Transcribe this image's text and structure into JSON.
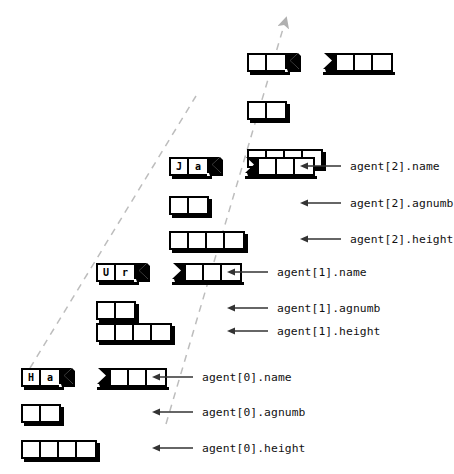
{
  "diagram": {
    "background": "#ffffff",
    "ink": "#000000",
    "guide_color": "#b8b8b8",
    "guides": [
      {
        "name": "array-progression-line-left",
        "x1": 30,
        "y1": 368,
        "x2": 196,
        "y2": 96,
        "arrow": false
      },
      {
        "name": "array-progression-line-right",
        "x1": 166,
        "y1": 424,
        "x2": 287,
        "y2": 18,
        "arrow": true
      }
    ],
    "fields": [
      {
        "key": "name",
        "cells_left": 2,
        "cells_right": 3,
        "torn": true,
        "label_suffix": ".name"
      },
      {
        "key": "agnumb",
        "cells_left": 2,
        "cells_right": 0,
        "torn": false,
        "label_suffix": ".agnumb"
      },
      {
        "key": "height",
        "cells_left": 4,
        "cells_right": 0,
        "torn": false,
        "label_suffix": ".height"
      }
    ],
    "records": [
      {
        "index": "partial",
        "visible": false,
        "name_chars": [
          "",
          ""
        ],
        "name_tail_cells": 3,
        "agnumb_cells": 2,
        "height_cells": 4,
        "labels": {
          "name": "",
          "agnumb": "",
          "height": ""
        }
      },
      {
        "index": "2",
        "visible": true,
        "name_chars": [
          "J",
          "a"
        ],
        "name_tail_cells": 3,
        "agnumb_cells": 2,
        "height_cells": 4,
        "labels": {
          "name": "agent[2].name",
          "agnumb": "agent[2].agnumb",
          "height": "agent[2].height"
        }
      },
      {
        "index": "1",
        "visible": true,
        "name_chars": [
          "U",
          "r"
        ],
        "name_tail_cells": 3,
        "agnumb_cells": 2,
        "height_cells": 4,
        "labels": {
          "name": "agent[1].name",
          "agnumb": "agent[1].agnumb",
          "height": "agent[1].height"
        }
      },
      {
        "index": "0",
        "visible": true,
        "name_chars": [
          "H",
          "a"
        ],
        "name_tail_cells": 3,
        "agnumb_cells": 2,
        "height_cells": 4,
        "labels": {
          "name": "agent[0].name",
          "agnumb": "agent[0].agnumb",
          "height": "agent[0].height"
        }
      }
    ]
  }
}
